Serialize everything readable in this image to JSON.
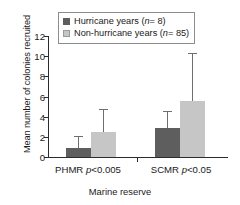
{
  "chart_data": {
    "type": "bar",
    "title": "",
    "xlabel": "Marine reserve",
    "ylabel": "Mean number of colonies recruited",
    "categories": [
      "PHMR p<0.005",
      "SCMR p<0.05"
    ],
    "category_labels": [
      {
        "reserve": "PHMR",
        "stat": "p",
        "comparison": "<0.005"
      },
      {
        "reserve": "SCMR",
        "stat": "p",
        "comparison": "<0.05"
      }
    ],
    "ylim": [
      0,
      12
    ],
    "yticks": [
      0,
      2,
      4,
      6,
      8,
      10,
      12
    ],
    "ytick_labels": [
      "0",
      "2",
      "4",
      "6",
      "8",
      "10",
      "12"
    ],
    "grid": false,
    "legend_position": "top-center",
    "error_bars": "upper only (SE)",
    "series": [
      {
        "name": "Hurricane years (n = 8)",
        "label_text": "Hurricane years (",
        "n_symbol": "n",
        "n_value": " = 8)",
        "color": "#5e5e5e",
        "values": [
          0.85,
          2.9
        ],
        "errors_upper": [
          2.0,
          4.5
        ]
      },
      {
        "name": "Non-hurricane years (n = 85)",
        "label_text": "Non-hurricane years (",
        "n_symbol": "n",
        "n_value": " = 85)",
        "color": "#c6c6c6",
        "values": [
          2.5,
          5.55
        ],
        "errors_upper": [
          4.7,
          10.2
        ]
      }
    ]
  },
  "colors": {
    "dark_bar": "#5e5e5e",
    "light_bar": "#c6c6c6",
    "axis": "#2b2b2b",
    "legend_border": "#8d8d8d",
    "background": "#ffffff"
  }
}
